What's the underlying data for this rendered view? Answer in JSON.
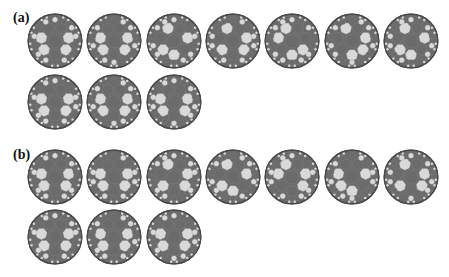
{
  "panels": [
    {
      "label": "(a)",
      "label_pos": [
        13,
        10
      ],
      "rows": [
        {
          "y": 13,
          "count": 7
        },
        {
          "y": 74,
          "count": 3
        }
      ],
      "patterns": [
        [
          1,
          0,
          0,
          1,
          0,
          0,
          1,
          0,
          1,
          0,
          0,
          1,
          1,
          0,
          1,
          0,
          0,
          1,
          0,
          1
        ],
        [
          1,
          0,
          0,
          1,
          0,
          0,
          1,
          1,
          0,
          0,
          1,
          0,
          1,
          1,
          0,
          0,
          1,
          0,
          1,
          0
        ],
        [
          1,
          0,
          1,
          0,
          0,
          1,
          0,
          0,
          1,
          1,
          0,
          1,
          0,
          0,
          1,
          1,
          0,
          0,
          1,
          0
        ],
        [
          1,
          0,
          0,
          1,
          0,
          1,
          0,
          1,
          0,
          1,
          0,
          0,
          1,
          0,
          1,
          0,
          1,
          0,
          0,
          1
        ],
        [
          1,
          1,
          0,
          0,
          1,
          0,
          0,
          0,
          1,
          0,
          1,
          1,
          0,
          0,
          1,
          0,
          0,
          1,
          1,
          0
        ],
        [
          1,
          0,
          0,
          0,
          1,
          1,
          0,
          1,
          0,
          0,
          1,
          0,
          1,
          1,
          0,
          1,
          0,
          0,
          1,
          0
        ],
        [
          1,
          0,
          1,
          0,
          0,
          1,
          0,
          0,
          1,
          0,
          1,
          0,
          0,
          1,
          1,
          0,
          1,
          0,
          0,
          1
        ],
        [
          1,
          0,
          0,
          1,
          0,
          0,
          1,
          0,
          1,
          1,
          0,
          0,
          1,
          0,
          1,
          0,
          0,
          1,
          0,
          1
        ],
        [
          1,
          0,
          0,
          1,
          0,
          0,
          1,
          1,
          0,
          0,
          1,
          0,
          1,
          0,
          0,
          1,
          1,
          0,
          1,
          0
        ],
        [
          1,
          0,
          0,
          1,
          0,
          0,
          1,
          0,
          1,
          0,
          1,
          0,
          0,
          1,
          0,
          1,
          1,
          0,
          0,
          1
        ]
      ]
    },
    {
      "label": "(b)",
      "label_pos": [
        13,
        147
      ],
      "rows": [
        {
          "y": 149,
          "count": 7
        },
        {
          "y": 209,
          "count": 3
        }
      ],
      "patterns": [
        [
          1,
          0,
          0,
          1,
          0,
          0,
          1,
          0,
          1,
          0,
          1,
          1,
          0,
          0,
          1,
          0,
          0,
          1,
          0,
          1
        ],
        [
          1,
          0,
          0,
          1,
          0,
          0,
          1,
          1,
          0,
          1,
          0,
          0,
          1,
          0,
          1,
          0,
          1,
          0,
          0,
          1
        ],
        [
          1,
          0,
          0,
          1,
          0,
          1,
          0,
          0,
          1,
          0,
          0,
          1,
          0,
          1,
          1,
          0,
          0,
          1,
          1,
          0
        ],
        [
          1,
          0,
          1,
          0,
          0,
          1,
          0,
          1,
          0,
          0,
          1,
          0,
          1,
          0,
          1,
          1,
          0,
          0,
          1,
          0
        ],
        [
          1,
          0,
          0,
          1,
          1,
          0,
          0,
          0,
          1,
          1,
          0,
          1,
          0,
          0,
          1,
          0,
          1,
          0,
          0,
          1
        ],
        [
          1,
          0,
          1,
          0,
          0,
          0,
          1,
          1,
          0,
          1,
          0,
          0,
          1,
          1,
          0,
          0,
          1,
          0,
          1,
          0
        ],
        [
          1,
          0,
          0,
          1,
          0,
          1,
          0,
          0,
          1,
          0,
          1,
          0,
          0,
          1,
          0,
          1,
          1,
          0,
          0,
          1
        ],
        [
          1,
          0,
          0,
          1,
          0,
          0,
          1,
          0,
          1,
          0,
          0,
          1,
          1,
          0,
          1,
          0,
          0,
          1,
          0,
          1
        ],
        [
          1,
          0,
          0,
          1,
          0,
          0,
          1,
          1,
          0,
          0,
          1,
          0,
          1,
          0,
          1,
          0,
          0,
          1,
          1,
          0
        ],
        [
          1,
          0,
          0,
          1,
          0,
          0,
          1,
          0,
          1,
          1,
          0,
          0,
          1,
          0,
          0,
          1,
          0,
          1,
          0,
          1
        ]
      ]
    }
  ],
  "layout": {
    "x0": 27,
    "dx": 59.3,
    "size": 56
  },
  "colors": {
    "dark": "#6b6b6b",
    "light": "#d9d9d9",
    "outline": "#4a4a4a",
    "edge": "#8a8a8a",
    "background": "#ffffff"
  }
}
